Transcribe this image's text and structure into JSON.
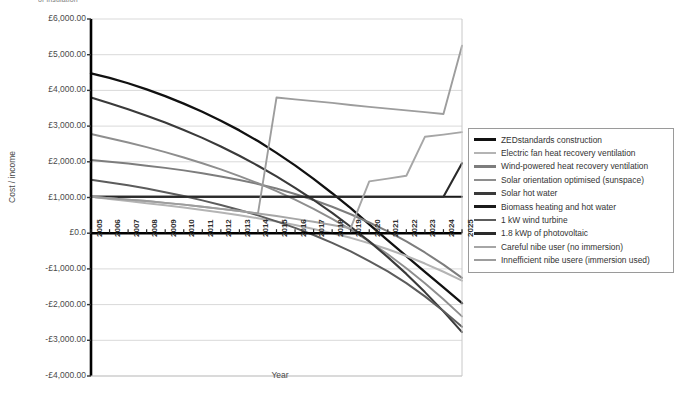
{
  "top_clipped_text": "of insulation",
  "chart_data": {
    "type": "line",
    "title": "",
    "xlabel": "Year",
    "ylabel": "Cost / income",
    "xlim": [
      2005,
      2025
    ],
    "ylim": [
      -4000,
      6000
    ],
    "grid": true,
    "legend_position": "right",
    "y_tick_labels": [
      "£6,000.00",
      "£5,000.00",
      "£4,000.00",
      "£3,000.00",
      "£2,000.00",
      "£1,000.00",
      "£0.0",
      "-£1,000.00",
      "-£2,000.00",
      "-£3,000.00",
      "-£4,000.00"
    ],
    "y_tick_values": [
      6000,
      5000,
      4000,
      3000,
      2000,
      1000,
      0,
      -1000,
      -2000,
      -3000,
      -4000
    ],
    "categories": [
      "2005",
      "2006",
      "2007",
      "2008",
      "2009",
      "2010",
      "2011",
      "2012",
      "2013",
      "2014",
      "2015",
      "2016",
      "2017",
      "2018",
      "2019",
      "2020",
      "2021",
      "2022",
      "2023",
      "2024",
      "2025"
    ],
    "series": [
      {
        "name": "ZEDstandards construction",
        "color": "#111111",
        "width": 2.3,
        "values": [
          4480,
          4350,
          4200,
          4030,
          3840,
          3630,
          3400,
          3150,
          2880,
          2580,
          2250,
          1900,
          1520,
          1120,
          700,
          250,
          -200,
          -640,
          -1080,
          -1520,
          -1960
        ]
      },
      {
        "name": "Electric fan heat recovery ventilation",
        "color": "#b4b4b4",
        "width": 2.0,
        "values": [
          1020,
          960,
          900,
          840,
          780,
          720,
          650,
          580,
          500,
          420,
          330,
          230,
          120,
          0,
          -130,
          -280,
          -450,
          -640,
          -850,
          -1080,
          -1330
        ]
      },
      {
        "name": "Wind-powered heat recovery ventilation",
        "color": "#7d7d7d",
        "width": 2.0,
        "values": [
          2050,
          2000,
          1950,
          1890,
          1830,
          1760,
          1680,
          1590,
          1490,
          1380,
          1250,
          1100,
          930,
          740,
          530,
          300,
          50,
          -230,
          -540,
          -880,
          -1250
        ]
      },
      {
        "name": "Solar orientation optimised (sunspace)",
        "color": "#8e8e8e",
        "width": 1.9,
        "values": [
          2780,
          2660,
          2540,
          2410,
          2270,
          2120,
          1960,
          1790,
          1600,
          1400,
          1180,
          940,
          680,
          400,
          100,
          -230,
          -590,
          -980,
          -1400,
          -1850,
          -2330
        ]
      },
      {
        "name": "Solar hot water",
        "color": "#3a3a3a",
        "width": 2.1,
        "values": [
          3800,
          3640,
          3470,
          3290,
          3100,
          2890,
          2670,
          2430,
          2170,
          1890,
          1590,
          1270,
          930,
          570,
          180,
          -230,
          -670,
          -1140,
          -1650,
          -2190,
          -2770
        ]
      },
      {
        "name": "Biomass heating and hot water",
        "color": "#1b1b1b",
        "width": 2.1,
        "values": [
          1020,
          1020,
          1020,
          1020,
          1020,
          1020,
          1020,
          1020,
          1020,
          1020,
          1020,
          1020,
          1020,
          1020,
          1020,
          1020,
          1020,
          1020,
          1020,
          1020,
          1020
        ]
      },
      {
        "name": "1 kW wind turbine",
        "color": "#5c5c5c",
        "width": 2.0,
        "values": [
          1500,
          1420,
          1340,
          1250,
          1150,
          1040,
          920,
          790,
          650,
          500,
          330,
          150,
          -50,
          -270,
          -510,
          -780,
          -1070,
          -1400,
          -1770,
          -2180,
          -2620
        ]
      },
      {
        "name": "1.8 kWp of photovoltaic",
        "color": "#2a2a2a",
        "width": 2.1,
        "values": [
          1020,
          1020,
          1020,
          1020,
          1020,
          1020,
          1020,
          1020,
          1020,
          1020,
          1020,
          1020,
          1020,
          1020,
          1020,
          1020,
          1020,
          1020,
          1020,
          1020,
          1960
        ]
      },
      {
        "name": "Careful nibe user (no immersion)",
        "color": "#a6a6a6",
        "width": 1.9,
        "values": [
          1020,
          980,
          940,
          900,
          850,
          800,
          740,
          680,
          620,
          550,
          480,
          400,
          320,
          230,
          140,
          1450,
          1530,
          1610,
          2700,
          2760,
          2830
        ]
      },
      {
        "name": "Innefficient nibe usere (immersion used)",
        "color": "#9d9d9d",
        "width": 1.9,
        "values": [
          1020,
          980,
          940,
          900,
          850,
          800,
          740,
          680,
          620,
          550,
          3800,
          3750,
          3700,
          3650,
          3590,
          3540,
          3490,
          3440,
          3390,
          3340,
          5250
        ]
      }
    ]
  }
}
